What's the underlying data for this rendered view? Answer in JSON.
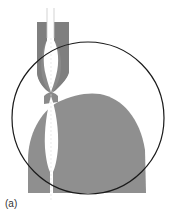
{
  "figure": {
    "label": "(a)",
    "colors": {
      "fill_gray": "#8a8a8a",
      "fill_gray_light": "#9a9a9a",
      "channel_white": "#ffffff",
      "circle_stroke": "#1a1a1a",
      "background": "#ffffff"
    },
    "elements": [
      "needle-channel",
      "upper-block",
      "pinched-neck",
      "lens-cavity",
      "dome-body",
      "magnification-circle"
    ]
  }
}
